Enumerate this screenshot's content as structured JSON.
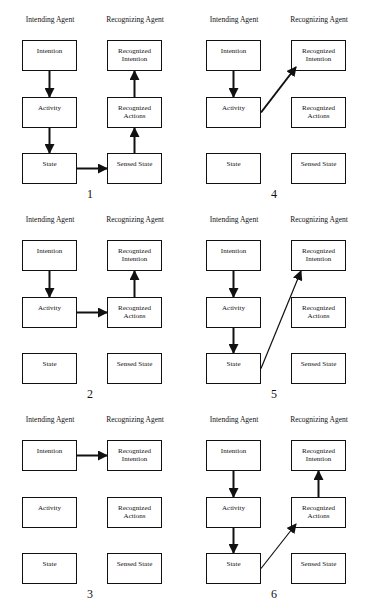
{
  "headers": {
    "left": "Intending Agent",
    "right": "Recognizing Agent"
  },
  "boxes": {
    "intention": "Intention",
    "activity": "Activity",
    "state": "State",
    "recognized_intention": "Recognized Intention",
    "recognized_actions": "Recognized Actions",
    "sensed_state": "Sensed State"
  },
  "panels": [
    {
      "number": "1",
      "arrows": [
        [
          "intention",
          "activity"
        ],
        [
          "activity",
          "state"
        ],
        [
          "state",
          "sensed_state"
        ],
        [
          "sensed_state",
          "recognized_actions"
        ],
        [
          "recognized_actions",
          "recognized_intention"
        ]
      ]
    },
    {
      "number": "4",
      "arrows": [
        [
          "intention",
          "activity"
        ],
        [
          "activity",
          "recognized_intention"
        ]
      ]
    },
    {
      "number": "2",
      "arrows": [
        [
          "intention",
          "activity"
        ],
        [
          "activity",
          "recognized_actions"
        ],
        [
          "recognized_actions",
          "recognized_intention"
        ]
      ]
    },
    {
      "number": "5",
      "arrows": [
        [
          "intention",
          "activity"
        ],
        [
          "activity",
          "state"
        ],
        [
          "state",
          "recognized_intention"
        ]
      ]
    },
    {
      "number": "3",
      "arrows": [
        [
          "intention",
          "recognized_intention"
        ]
      ]
    },
    {
      "number": "6",
      "arrows": [
        [
          "intention",
          "activity"
        ],
        [
          "activity",
          "state"
        ],
        [
          "state",
          "recognized_actions"
        ],
        [
          "recognized_actions",
          "recognized_intention"
        ]
      ]
    }
  ]
}
